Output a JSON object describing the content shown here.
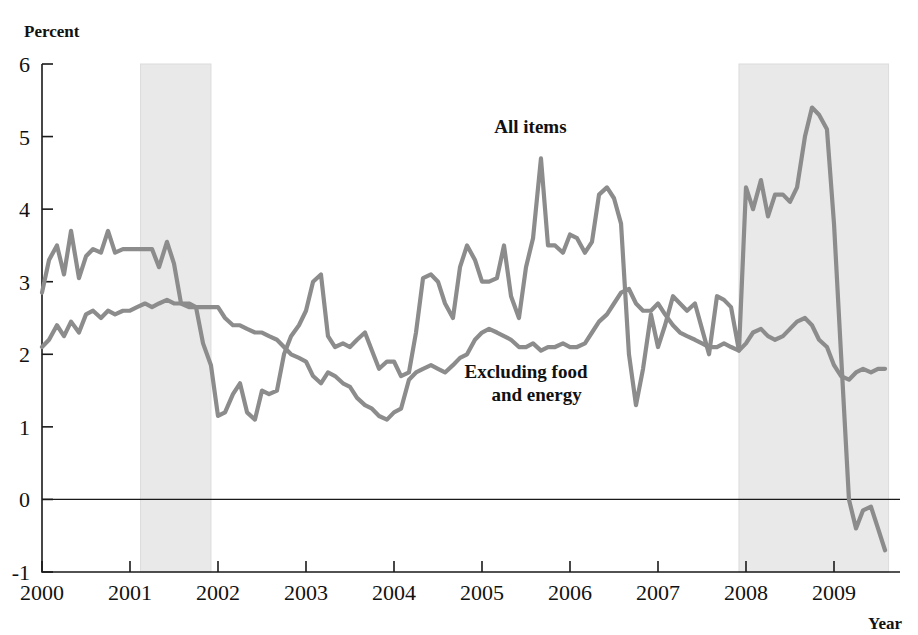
{
  "chart_data": {
    "type": "line",
    "title": "",
    "xlabel": "Year",
    "ylabel": "Percent",
    "ylim": [
      -1,
      6
    ],
    "xlim": [
      2000,
      2009.75
    ],
    "grid": false,
    "legend_position": "inline-annotation",
    "y_ticks": [
      "6",
      "5",
      "4",
      "3",
      "2",
      "1",
      "0",
      "-1"
    ],
    "y_tick_values": [
      6,
      5,
      4,
      3,
      2,
      1,
      0,
      -1
    ],
    "x_ticks": [
      "2000",
      "2001",
      "2002",
      "2003",
      "2004",
      "2005",
      "2006",
      "2007",
      "2008",
      "2009"
    ],
    "x_tick_values": [
      2000,
      2001,
      2002,
      2003,
      2004,
      2005,
      2006,
      2007,
      2008,
      2009
    ],
    "annotations": [
      {
        "name": "all-items-label",
        "text": "All items",
        "x": 2005.55,
        "y": 5.05
      },
      {
        "name": "core-label-line1",
        "text": "Excluding food",
        "x": 2005.5,
        "y": 1.68
      },
      {
        "name": "core-label-line2",
        "text": "and energy",
        "x": 2005.62,
        "y": 1.35
      }
    ],
    "shaded_regions": [
      {
        "name": "recession-2001",
        "x0": 2001.12,
        "x1": 2001.92,
        "color": "#e9e9e9"
      },
      {
        "name": "recession-2008",
        "x0": 2007.92,
        "x1": 2009.62,
        "color": "#e9e9e9"
      }
    ],
    "series": [
      {
        "name": "All items",
        "color": "#8c8c8c",
        "x": [
          2000.0,
          2000.08,
          2000.17,
          2000.25,
          2000.33,
          2000.42,
          2000.5,
          2000.58,
          2000.67,
          2000.75,
          2000.83,
          2000.92,
          2001.0,
          2001.08,
          2001.17,
          2001.25,
          2001.33,
          2001.42,
          2001.5,
          2001.58,
          2001.67,
          2001.75,
          2001.83,
          2001.92,
          2002.0,
          2002.08,
          2002.17,
          2002.25,
          2002.33,
          2002.42,
          2002.5,
          2002.58,
          2002.67,
          2002.75,
          2002.83,
          2002.92,
          2003.0,
          2003.08,
          2003.17,
          2003.25,
          2003.33,
          2003.42,
          2003.5,
          2003.58,
          2003.67,
          2003.75,
          2003.83,
          2003.92,
          2004.0,
          2004.08,
          2004.17,
          2004.25,
          2004.33,
          2004.42,
          2004.5,
          2004.58,
          2004.67,
          2004.75,
          2004.83,
          2004.92,
          2005.0,
          2005.08,
          2005.17,
          2005.25,
          2005.33,
          2005.42,
          2005.5,
          2005.58,
          2005.67,
          2005.75,
          2005.83,
          2005.92,
          2006.0,
          2006.08,
          2006.17,
          2006.25,
          2006.33,
          2006.42,
          2006.5,
          2006.58,
          2006.67,
          2006.75,
          2006.83,
          2006.92,
          2007.0,
          2007.08,
          2007.17,
          2007.25,
          2007.33,
          2007.42,
          2007.5,
          2007.58,
          2007.67,
          2007.75,
          2007.83,
          2007.92,
          2008.0,
          2008.08,
          2008.17,
          2008.25,
          2008.33,
          2008.42,
          2008.5,
          2008.58,
          2008.67,
          2008.75,
          2008.83,
          2008.92,
          2009.0,
          2009.08,
          2009.17,
          2009.25,
          2009.33,
          2009.42,
          2009.5,
          2009.58
        ],
        "values": [
          2.85,
          3.3,
          3.5,
          3.1,
          3.7,
          3.05,
          3.35,
          3.45,
          3.4,
          3.7,
          3.4,
          3.45,
          3.45,
          3.45,
          3.45,
          3.45,
          3.2,
          3.55,
          3.25,
          2.7,
          2.7,
          2.65,
          2.15,
          1.85,
          1.15,
          1.2,
          1.45,
          1.6,
          1.2,
          1.1,
          1.5,
          1.45,
          1.5,
          2.0,
          2.25,
          2.4,
          2.6,
          3.0,
          3.1,
          2.25,
          2.1,
          2.15,
          2.1,
          2.2,
          2.3,
          2.05,
          1.8,
          1.9,
          1.9,
          1.7,
          1.75,
          2.3,
          3.05,
          3.1,
          3.0,
          2.7,
          2.5,
          3.2,
          3.5,
          3.3,
          3.0,
          3.0,
          3.05,
          3.5,
          2.8,
          2.5,
          3.2,
          3.6,
          4.7,
          3.5,
          3.5,
          3.4,
          3.65,
          3.6,
          3.4,
          3.55,
          4.2,
          4.3,
          4.15,
          3.8,
          2.0,
          1.3,
          1.8,
          2.55,
          2.1,
          2.4,
          2.8,
          2.7,
          2.6,
          2.7,
          2.35,
          2.0,
          2.8,
          2.75,
          2.65,
          2.05,
          4.3,
          4.0,
          4.4,
          3.9,
          4.2,
          4.2,
          4.1,
          4.3,
          5.0,
          5.4,
          5.3,
          5.1,
          3.8,
          2.0,
          0.0,
          -0.4,
          -0.15,
          -0.1,
          -0.4,
          -0.7
        ]
      },
      {
        "name": "Excluding food and energy",
        "color": "#8c8c8c",
        "x": [
          2000.0,
          2000.08,
          2000.17,
          2000.25,
          2000.33,
          2000.42,
          2000.5,
          2000.58,
          2000.67,
          2000.75,
          2000.83,
          2000.92,
          2001.0,
          2001.08,
          2001.17,
          2001.25,
          2001.33,
          2001.42,
          2001.5,
          2001.58,
          2001.67,
          2001.75,
          2001.83,
          2001.92,
          2002.0,
          2002.08,
          2002.17,
          2002.25,
          2002.33,
          2002.42,
          2002.5,
          2002.58,
          2002.67,
          2002.75,
          2002.83,
          2002.92,
          2003.0,
          2003.08,
          2003.17,
          2003.25,
          2003.33,
          2003.42,
          2003.5,
          2003.58,
          2003.67,
          2003.75,
          2003.83,
          2003.92,
          2004.0,
          2004.08,
          2004.17,
          2004.25,
          2004.33,
          2004.42,
          2004.5,
          2004.58,
          2004.67,
          2004.75,
          2004.83,
          2004.92,
          2005.0,
          2005.08,
          2005.17,
          2005.25,
          2005.33,
          2005.42,
          2005.5,
          2005.58,
          2005.67,
          2005.75,
          2005.83,
          2005.92,
          2006.0,
          2006.08,
          2006.17,
          2006.25,
          2006.33,
          2006.42,
          2006.5,
          2006.58,
          2006.67,
          2006.75,
          2006.83,
          2006.92,
          2007.0,
          2007.08,
          2007.17,
          2007.25,
          2007.33,
          2007.42,
          2007.5,
          2007.58,
          2007.67,
          2007.75,
          2007.83,
          2007.92,
          2008.0,
          2008.08,
          2008.17,
          2008.25,
          2008.33,
          2008.42,
          2008.5,
          2008.58,
          2008.67,
          2008.75,
          2008.83,
          2008.92,
          2009.0,
          2009.08,
          2009.17,
          2009.25,
          2009.33,
          2009.42,
          2009.5,
          2009.58
        ],
        "values": [
          2.1,
          2.2,
          2.4,
          2.25,
          2.45,
          2.3,
          2.55,
          2.6,
          2.5,
          2.6,
          2.55,
          2.6,
          2.6,
          2.65,
          2.7,
          2.65,
          2.7,
          2.75,
          2.7,
          2.7,
          2.65,
          2.65,
          2.65,
          2.65,
          2.65,
          2.5,
          2.4,
          2.4,
          2.35,
          2.3,
          2.3,
          2.25,
          2.2,
          2.1,
          2.0,
          1.95,
          1.9,
          1.7,
          1.6,
          1.75,
          1.7,
          1.6,
          1.55,
          1.4,
          1.3,
          1.25,
          1.15,
          1.1,
          1.2,
          1.25,
          1.65,
          1.75,
          1.8,
          1.85,
          1.8,
          1.75,
          1.85,
          1.95,
          2.0,
          2.2,
          2.3,
          2.35,
          2.3,
          2.25,
          2.2,
          2.1,
          2.1,
          2.15,
          2.05,
          2.1,
          2.1,
          2.15,
          2.1,
          2.1,
          2.15,
          2.3,
          2.45,
          2.55,
          2.7,
          2.85,
          2.9,
          2.7,
          2.6,
          2.6,
          2.7,
          2.55,
          2.4,
          2.3,
          2.25,
          2.2,
          2.15,
          2.1,
          2.1,
          2.15,
          2.1,
          2.05,
          2.15,
          2.3,
          2.35,
          2.25,
          2.2,
          2.25,
          2.35,
          2.45,
          2.5,
          2.4,
          2.2,
          2.1,
          1.85,
          1.7,
          1.65,
          1.75,
          1.8,
          1.75,
          1.8,
          1.8
        ]
      }
    ]
  }
}
